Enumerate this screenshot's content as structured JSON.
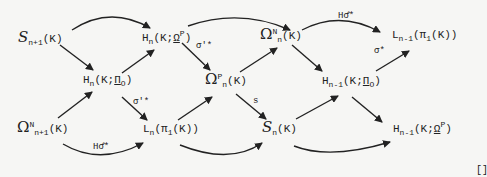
{
  "diagram": {
    "nodes": {
      "S_n1": {
        "sym": "S",
        "sub": "n+1",
        "arg": "(K)"
      },
      "H_n_K_PiO": {
        "sym": "H",
        "sub": "n",
        "arg": "(K;",
        "coef": "Π",
        "coefsub": "O",
        "close": ")"
      },
      "Omega_N_n1": {
        "sym": "Ω",
        "sup": "N",
        "sub": "n+1",
        "arg": "(K)"
      },
      "H_n_K_OmegaP": {
        "sym": "H",
        "sub": "n",
        "arg": "(K;",
        "coef": "Ω",
        "coefsup": "P",
        "close": ")"
      },
      "Omega_P_n": {
        "sym": "Ω",
        "sup": "P",
        "sub": "n",
        "arg": "(K)"
      },
      "L_n_pi1": {
        "sym": "L",
        "sub": "n",
        "arg": "(π",
        "argsub": "1",
        "close": "(K))"
      },
      "Omega_N_n": {
        "sym": "Ω",
        "sup": "N",
        "sub": "n",
        "arg": "(K)"
      },
      "S_n": {
        "sym": "S",
        "sub": "n",
        "arg": "(K)"
      },
      "H_n1_K_PiO": {
        "sym": "H",
        "sub": "n-1",
        "arg": "(K;",
        "coef": "Π",
        "coefsub": "O",
        "close": ")"
      },
      "L_n1_pi1": {
        "sym": "L",
        "sub": "n-1",
        "arg": "(π",
        "argsub": "1",
        "close": "(K))"
      },
      "H_n1_K_OmegaP": {
        "sym": "H",
        "sub": "n-1",
        "arg": "(K;",
        "coef": "Ω",
        "coefsup": "P",
        "close": ")"
      }
    },
    "labels": {
      "sigma_prime_star": "σ'*",
      "sigma_prime_lower_star": "σ'*",
      "H_sigma_hat_star_top": "Hσ̂*",
      "H_sigma_hat_star_bottom": "Hσ̂*",
      "s": "s",
      "sigma_lower_star": "σ*"
    },
    "end_mark": "[]"
  }
}
